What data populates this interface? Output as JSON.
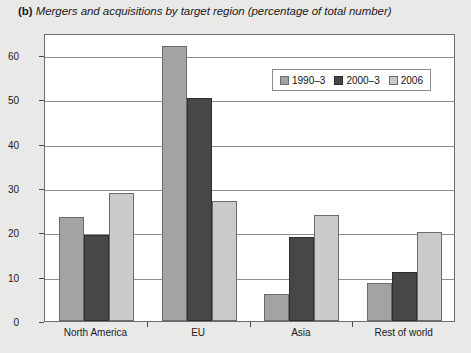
{
  "figure": {
    "panel_label": "(b)",
    "title": "Mergers and acquisitions by target region (percentage of total number)"
  },
  "chart_data": {
    "type": "bar",
    "title": "Mergers and acquisitions by target region (percentage of total number)",
    "xlabel": "",
    "ylabel": "Percentage of total",
    "ylim": [
      0,
      65
    ],
    "yticks": [
      0,
      10,
      20,
      30,
      40,
      50,
      60
    ],
    "ytick_labels": [
      "0",
      "10",
      "20",
      "30",
      "40",
      "50",
      "60"
    ],
    "grid": true,
    "legend_position": "top-right-inside",
    "categories": [
      "North America",
      "EU",
      "Asia",
      "Rest of world"
    ],
    "series": [
      {
        "name": "1990-3",
        "label": "1990–3",
        "color": "#a3a3a3",
        "values": [
          23.5,
          62,
          6,
          8.5
        ]
      },
      {
        "name": "2000-3",
        "label": "2000–3",
        "color": "#474747",
        "values": [
          19.5,
          50.3,
          19,
          11
        ]
      },
      {
        "name": "2006",
        "label": "2006",
        "color": "#cacaca",
        "values": [
          29,
          27,
          24,
          20
        ]
      }
    ]
  },
  "colors": {
    "page_background": "#e9e9e7",
    "plot_background": "#ffffff",
    "axis": "#6d6d6d",
    "gridline": "#8e8e8e",
    "text": "#1b1b1b"
  }
}
